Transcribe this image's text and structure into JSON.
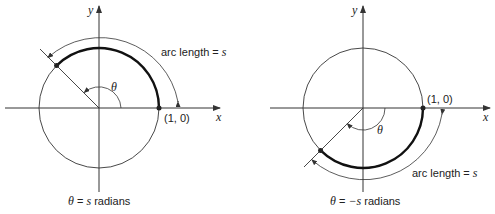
{
  "left_figure": {
    "axis_x_label": "x",
    "axis_y_label": "y",
    "point_label": "(1, 0)",
    "angle_label": "θ",
    "arc_label_text": "arc length = ",
    "arc_label_var": "s",
    "caption_theta": "θ",
    "caption_eq": " = ",
    "caption_var": "s",
    "caption_unit": " radians"
  },
  "right_figure": {
    "axis_x_label": "x",
    "axis_y_label": "y",
    "point_label": "(1, 0)",
    "angle_label": "θ",
    "arc_label_text": "arc length = ",
    "arc_label_var": "s",
    "caption_theta": "θ",
    "caption_eq": " = ",
    "caption_var": "−s",
    "caption_unit": " radians"
  },
  "colors": {
    "stroke": "#333333",
    "arc_highlight": "#111111"
  }
}
